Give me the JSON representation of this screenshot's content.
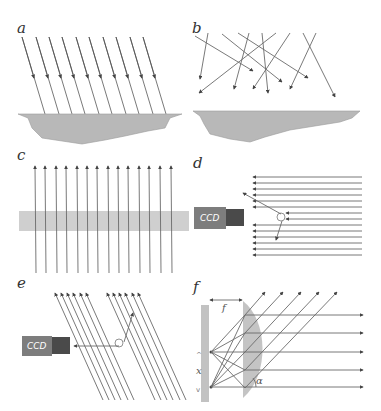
{
  "figure": {
    "panels": [
      {
        "id": "a",
        "label": "a",
        "description": "Parallel collimated light rays incident obliquely on a rough surface",
        "ray_count": 10
      },
      {
        "id": "b",
        "label": "b",
        "description": "Diffuse (random-direction) light rays above a rough surface",
        "ray_count": 10
      },
      {
        "id": "c",
        "label": "c",
        "description": "Parallel rays passing upward through a transparent slab",
        "ray_count": 14
      },
      {
        "id": "d",
        "label": "d",
        "description": "Horizontal collimated rays scattered by a particle toward a CCD camera",
        "ray_count": 14,
        "camera_label": "CCD"
      },
      {
        "id": "e",
        "label": "e",
        "description": "Oblique collimated rays scattered by a particle toward a CCD camera",
        "ray_count": 12,
        "camera_label": "CCD"
      },
      {
        "id": "f",
        "label": "f",
        "description": "Point sources at a screen collimated by a lens at focal distance f",
        "focal_label": "f",
        "distance_label": "x",
        "angle_label": "α"
      }
    ]
  },
  "colors": {
    "ray": "#6a6a6a",
    "surface": "#b8b8b8",
    "ccd_body": "#7d7d7d",
    "ccd_lens": "#4a4a4a",
    "slab": "#cfcfcf",
    "lens": "#c4c4c4"
  }
}
